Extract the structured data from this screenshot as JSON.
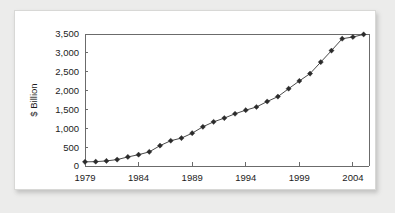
{
  "chart_data": {
    "type": "line",
    "title": "",
    "subtitle": "",
    "xlabel": "",
    "ylabel": "$ Billion",
    "xlim": [
      1979,
      2005.5
    ],
    "ylim": [
      0,
      3500
    ],
    "grid": false,
    "legend": null,
    "marker": "diamond",
    "y_ticks": [
      0,
      500,
      1000,
      1500,
      2000,
      2500,
      3000,
      3500
    ],
    "y_tick_labels": [
      "0",
      "500",
      "1,000",
      "1,500",
      "2,000",
      "2,500",
      "3,000",
      "3,500"
    ],
    "x_ticks": [
      1979,
      1984,
      1989,
      1994,
      1999,
      2004
    ],
    "x_tick_labels": [
      "1979",
      "1984",
      "1989",
      "1994",
      "1999",
      "2004"
    ],
    "x": [
      1979,
      1980,
      1981,
      1982,
      1983,
      1984,
      1985,
      1986,
      1987,
      1988,
      1989,
      1990,
      1991,
      1992,
      1993,
      1994,
      1995,
      1996,
      1997,
      1998,
      1999,
      2000,
      2001,
      2002,
      2003,
      2004,
      2005
    ],
    "values": [
      110,
      115,
      135,
      170,
      240,
      300,
      375,
      540,
      670,
      740,
      870,
      1040,
      1170,
      1270,
      1385,
      1480,
      1565,
      1710,
      1840,
      2050,
      2255,
      2450,
      2755,
      3060,
      3375,
      3420,
      3490
    ],
    "series": [
      {
        "name": "",
        "values": [
          110,
          115,
          135,
          170,
          240,
          300,
          375,
          540,
          670,
          740,
          870,
          1040,
          1170,
          1270,
          1385,
          1480,
          1565,
          1710,
          1840,
          2050,
          2255,
          2450,
          2755,
          3060,
          3375,
          3420,
          3490
        ]
      }
    ],
    "colors": {
      "line": "#4a4a4a",
      "marker": "#2b2b2b",
      "axis": "#6b6b6b",
      "plot_background": "#ffffff",
      "panel_background": "#ffffff",
      "page_background": "#ececeb"
    }
  }
}
